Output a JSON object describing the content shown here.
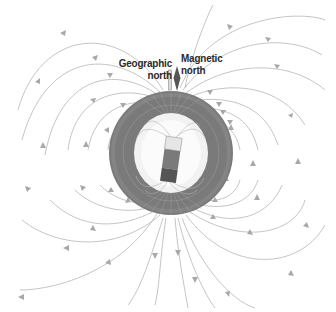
{
  "diagram": {
    "labels": {
      "geographic_north": [
        "Geographic",
        "north"
      ],
      "magnetic_north": [
        "Magnetic",
        "north"
      ]
    },
    "colors": {
      "background": "#ffffff",
      "field_lines": "#b8b8b8",
      "arrows": "#a8a8a8",
      "earth_ring": "#7a7a7a",
      "earth_core": "#f4f4f4",
      "magnet_top": "#e6e6e6",
      "magnet_body": "#777777",
      "magnet_bottom": "#555555",
      "axis_marker": "#555555",
      "text": "#2a2a2a"
    }
  }
}
